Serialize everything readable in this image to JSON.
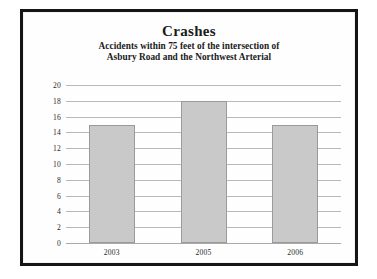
{
  "chart_data": {
    "type": "bar",
    "title": "Crashes",
    "subtitle_line1": "Accidents within 75 feet of the intersection of",
    "subtitle_line2": "Asbury Road and the Northwest Arterial",
    "categories": [
      "2003",
      "2005",
      "2006"
    ],
    "values": [
      15,
      18,
      15
    ],
    "series": [
      {
        "name": "Crashes",
        "values": [
          15,
          18,
          15
        ]
      }
    ],
    "xlabel": "",
    "ylabel": "",
    "ylim": [
      0,
      20
    ],
    "yticks": [
      0,
      2,
      4,
      6,
      8,
      10,
      12,
      14,
      16,
      18,
      20
    ],
    "ytick_labels": [
      "0",
      "2",
      "4",
      "6",
      "8",
      "10",
      "12",
      "14",
      "16",
      "18",
      "20"
    ],
    "grid": true,
    "legend": false,
    "bar_fill_color": "#c9c9c9",
    "bar_border_color": "#9a9a9a",
    "gridline_color": "#b9b9b9",
    "frame_color": "#151515",
    "background_color": "#ffffff"
  }
}
